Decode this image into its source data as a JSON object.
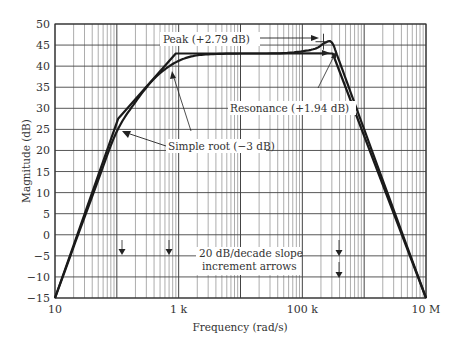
{
  "chart_data": {
    "type": "line",
    "title": "",
    "xlabel": "Frequency (rad/s)",
    "ylabel": "Magnitude (dB)",
    "xscale": "log",
    "xlim": [
      10,
      10000000
    ],
    "ylim": [
      -15,
      50
    ],
    "grid": true,
    "x_tick_labels": [
      {
        "value": 10,
        "label": "10"
      },
      {
        "value": 1000,
        "label": "1 k"
      },
      {
        "value": 100000,
        "label": "100 k"
      },
      {
        "value": 10000000,
        "label": "10 M"
      }
    ],
    "y_ticks": [
      50,
      45,
      40,
      35,
      30,
      25,
      20,
      15,
      10,
      5,
      0,
      -5,
      -10,
      -15
    ],
    "y_tick_labels": [
      "50",
      "45",
      "40",
      "35",
      "30",
      "25",
      "20",
      "15",
      "10",
      "5",
      "0",
      "−5",
      "−10",
      "−15"
    ],
    "series": [
      {
        "name": "Asymptotic (straight-line) approximation",
        "x": [
          10,
          105,
          900,
          310000,
          10000000
        ],
        "y": [
          -15,
          27.5,
          43,
          43,
          -15
        ]
      },
      {
        "name": "Actual magnitude",
        "x": [
          10,
          50,
          100,
          200,
          400,
          800,
          1500,
          3000,
          10000,
          50000,
          150000,
          230000,
          300000,
          400000,
          1000000,
          10000000
        ],
        "y": [
          -15,
          13,
          24.5,
          31.5,
          37,
          40.5,
          42.2,
          42.8,
          43,
          43.1,
          44,
          45.5,
          45.6,
          41,
          25,
          -15
        ]
      }
    ],
    "annotations": [
      {
        "text": "Peak (+2.79 dB)",
        "target_x": 220000,
        "target_y": 45.8
      },
      {
        "text": "Resonance (+1.94 dB)",
        "target_x": 220000,
        "target_y": 43
      },
      {
        "text": "Simple root (−3 dB)",
        "target_x": 130000,
        "target_y": 24.5,
        "also_points_to": {
          "x": 900,
          "y": 40
        }
      },
      {
        "text": "20 dB/decade slope increment arrows",
        "arrows_at": [
          100,
          900,
          220000,
          220000
        ]
      }
    ],
    "legend": null
  },
  "labels": {
    "xlabel": "Frequency (rad/s)",
    "ylabel": "Magnitude (dB)",
    "peak": "Peak (+2.79 dB)",
    "resonance": "Resonance (+1.94 dB)",
    "simple_root": "Simple root (−3 dB)",
    "slope_line1": "20 dB/decade slope",
    "slope_line2": "increment arrows"
  },
  "colors": {
    "grid": "#8a8a8a",
    "grid_major": "#444444",
    "curve": "#1a1a1a",
    "text": "#333333"
  }
}
